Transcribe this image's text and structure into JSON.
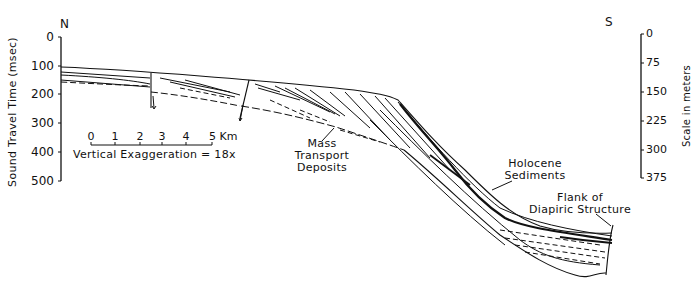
{
  "figure": {
    "orientation": {
      "left": "N",
      "right": "S"
    },
    "left_axis": {
      "label": "Sound Travel Time (msec)",
      "ticks": [
        "0",
        "100",
        "200",
        "300",
        "400",
        "500"
      ]
    },
    "right_axis": {
      "label": "Scale in meters",
      "ticks": [
        "0",
        "75",
        "150",
        "225",
        "300",
        "375"
      ]
    },
    "scale_bar": {
      "ticks": [
        "0",
        "1",
        "2",
        "3",
        "4",
        "5 Km"
      ],
      "caption": "Vertical Exaggeration = 18x"
    },
    "annotations": {
      "mass_transport": [
        "Mass",
        "Transport",
        "Deposits"
      ],
      "holocene": [
        "Holocene",
        "Sediments"
      ],
      "diapir": [
        "Flank of",
        "Diapiric Structure"
      ]
    },
    "colors": {
      "ink": "#111111",
      "background": "#ffffff"
    }
  }
}
